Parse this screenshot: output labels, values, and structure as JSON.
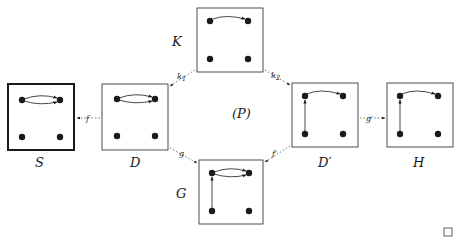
{
  "diagram": {
    "type": "graph-transformation-pushout",
    "center_label": "(P)",
    "qed_symbol": "□",
    "colors": {
      "ink": "#1a1a1a",
      "box_border": "#3a3a3a",
      "background": "#ffffff"
    },
    "graphs": [
      {
        "id": "S",
        "label": "S",
        "emphasized": true,
        "edges": [
          "top-left → top-right (double, parallel)"
        ]
      },
      {
        "id": "D",
        "label": "D",
        "emphasized": false,
        "edges": [
          "top-left → top-right (double, parallel)"
        ]
      },
      {
        "id": "K",
        "label": "K",
        "emphasized": false,
        "edges": [
          "top-left → top-right (single)"
        ]
      },
      {
        "id": "G",
        "label": "G",
        "emphasized": false,
        "edges": [
          "top-left → top-right (double, parallel)",
          "bottom-left → top-left"
        ]
      },
      {
        "id": "Dprime",
        "label": "D′",
        "emphasized": false,
        "edges": [
          "top-left → top-right (single)",
          "bottom-left → top-left"
        ]
      },
      {
        "id": "H",
        "label": "H",
        "emphasized": false,
        "edges": [
          "top-left → top-right (single)",
          "bottom-left → top-left"
        ]
      }
    ],
    "morphisms": [
      {
        "name": "f",
        "main": "f",
        "sub": "",
        "from": "D",
        "to": "S"
      },
      {
        "name": "k1",
        "main": "k",
        "sub": "1",
        "from": "K",
        "to": "D"
      },
      {
        "name": "k2",
        "main": "k",
        "sub": "2",
        "from": "K",
        "to": "D′"
      },
      {
        "name": "g",
        "main": "g",
        "sub": "",
        "from": "D",
        "to": "G"
      },
      {
        "name": "f'",
        "main": "f′",
        "sub": "",
        "from": "D′",
        "to": "G"
      },
      {
        "name": "g'",
        "main": "g′",
        "sub": "",
        "from": "D′",
        "to": "H"
      }
    ]
  }
}
